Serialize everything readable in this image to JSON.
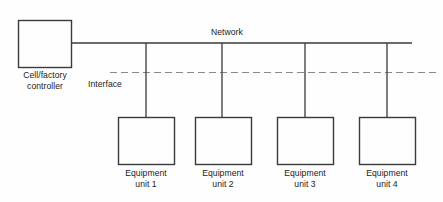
{
  "diagram": {
    "colors": {
      "stroke": "#3a3a3a",
      "dashed_stroke": "#8a8a8a",
      "background": "#fefefe",
      "text": "#1b1b1b"
    },
    "controller": {
      "label": "Cell/factory\ncontroller",
      "name": "cell-factory-controller"
    },
    "network": {
      "label": "Network",
      "name": "network-bus"
    },
    "interface": {
      "label": "Interface",
      "name": "interface-boundary"
    },
    "units": [
      {
        "label": "Equipment\nunit 1",
        "name": "equipment-unit-1"
      },
      {
        "label": "Equipment\nunit 2",
        "name": "equipment-unit-2"
      },
      {
        "label": "Equipment\nunit 3",
        "name": "equipment-unit-3"
      },
      {
        "label": "Equipment\nunit 4",
        "name": "equipment-unit-4"
      }
    ]
  }
}
